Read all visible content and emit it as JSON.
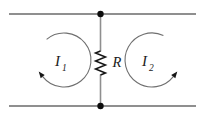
{
  "figure": {
    "type": "circuit-diagram",
    "background_color": "#ffffff",
    "wire_color": "#8f8f8f",
    "loop_color": "#6f6f6f",
    "component_color": "#161616",
    "node_color": "#0d0d0d",
    "text_color": "#1a1a1a",
    "resistor": {
      "label": "R"
    },
    "mesh_currents": [
      {
        "base": "I",
        "subscript": "1",
        "direction": "clockwise"
      },
      {
        "base": "I",
        "subscript": "2",
        "direction": "counterclockwise"
      }
    ]
  }
}
